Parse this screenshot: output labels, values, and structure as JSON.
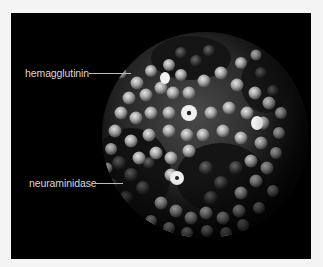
{
  "figure": {
    "background_color": "#f4f4f4",
    "panel_color": "#000000",
    "labels": [
      {
        "id": "hemagglutinin",
        "text": "hemagglutinin"
      },
      {
        "id": "neuraminidase",
        "text": "neuraminidase"
      }
    ]
  }
}
